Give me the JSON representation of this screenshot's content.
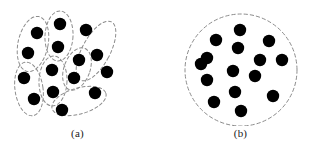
{
  "figure": {
    "background_color": "#ffffff",
    "dot_color": "#000000",
    "boundary_color": "#8c8c8c",
    "width": 311,
    "height": 157
  },
  "panels": [
    {
      "id": "a",
      "caption": "(a)",
      "boundary_type": "dashed-ellipse-clusters",
      "description": "Data points grouped into several elongated dashed clusters",
      "dot_count": 15,
      "cluster_count": 7
    },
    {
      "id": "b",
      "caption": "(b)",
      "boundary_type": "dashed-circle",
      "description": "Same data points enclosed by one large dashed circle",
      "dot_count": 15,
      "cluster_count": 1
    }
  ],
  "chart_data": {
    "type": "scatter",
    "title": "",
    "subtitle": "",
    "xlabel": "",
    "ylabel": "",
    "grid": false,
    "legend": null,
    "xlim": [
      0,
      155
    ],
    "ylim": [
      0,
      122
    ],
    "annotations": [
      "(a)",
      "(b)"
    ],
    "series": [
      {
        "name": "panel-a-points",
        "panel": "a",
        "marker": "filled-circle",
        "marker_radius": 6.2,
        "color": "#000000",
        "points": [
          {
            "x": 37,
            "y": 33,
            "cluster": 1
          },
          {
            "x": 28,
            "y": 53,
            "cluster": 1
          },
          {
            "x": 24,
            "y": 78,
            "cluster": 2
          },
          {
            "x": 34,
            "y": 99,
            "cluster": 2
          },
          {
            "x": 60,
            "y": 24,
            "cluster": 3
          },
          {
            "x": 58,
            "y": 47,
            "cluster": 3
          },
          {
            "x": 52,
            "y": 70,
            "cluster": 4
          },
          {
            "x": 53,
            "y": 92,
            "cluster": 4
          },
          {
            "x": 86,
            "y": 30,
            "cluster": 5
          },
          {
            "x": 97,
            "y": 55,
            "cluster": 5
          },
          {
            "x": 79,
            "y": 60,
            "cluster": 6
          },
          {
            "x": 74,
            "y": 78,
            "cluster": 6
          },
          {
            "x": 62,
            "y": 110,
            "cluster": 7
          },
          {
            "x": 95,
            "y": 93,
            "cluster": 7
          },
          {
            "x": 107,
            "y": 72,
            "cluster": 5
          }
        ]
      },
      {
        "name": "panel-b-points",
        "panel": "b",
        "marker": "filled-circle",
        "marker_radius": 6.2,
        "color": "#000000",
        "points": [
          {
            "x": 84,
            "y": 30
          },
          {
            "x": 60,
            "y": 40
          },
          {
            "x": 82,
            "y": 48
          },
          {
            "x": 113,
            "y": 41
          },
          {
            "x": 51,
            "y": 58
          },
          {
            "x": 104,
            "y": 60
          },
          {
            "x": 126,
            "y": 60
          },
          {
            "x": 77,
            "y": 71
          },
          {
            "x": 99,
            "y": 76
          },
          {
            "x": 51,
            "y": 80
          },
          {
            "x": 45,
            "y": 64
          },
          {
            "x": 79,
            "y": 92
          },
          {
            "x": 117,
            "y": 96
          },
          {
            "x": 58,
            "y": 102
          },
          {
            "x": 85,
            "y": 111
          }
        ]
      }
    ],
    "panel_a_clusters": [
      {
        "id": 1,
        "cx": 33,
        "cy": 44,
        "rx": 15,
        "ry": 28,
        "rotation": 12
      },
      {
        "id": 2,
        "cx": 29,
        "cy": 89,
        "rx": 14,
        "ry": 27,
        "rotation": -8
      },
      {
        "id": 3,
        "cx": 59,
        "cy": 36,
        "rx": 14,
        "ry": 25,
        "rotation": 3
      },
      {
        "id": 4,
        "cx": 53,
        "cy": 81,
        "rx": 14,
        "ry": 25,
        "rotation": 2
      },
      {
        "id": 5,
        "cx": 96,
        "cy": 51,
        "rx": 14,
        "ry": 33,
        "rotation": 28
      },
      {
        "id": 6,
        "cx": 77,
        "cy": 69,
        "rx": 13,
        "ry": 22,
        "rotation": 20
      },
      {
        "id": 7,
        "cx": 79,
        "cy": 101,
        "rx": 28,
        "ry": 13,
        "rotation": -16
      }
    ],
    "panel_b_boundary": {
      "cx": 85,
      "cy": 70,
      "r": 56
    }
  }
}
